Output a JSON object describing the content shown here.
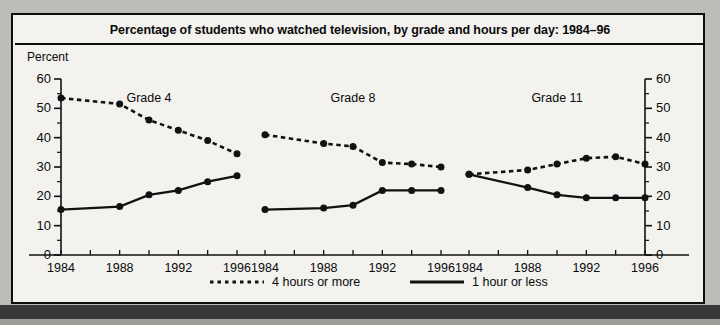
{
  "figure": {
    "title": "Percentage of students who watched television, by grade and hours per day: 1984–96",
    "axis_unit_label": "Percent"
  },
  "legend": {
    "items": [
      {
        "label": "4 hours or more",
        "style": "dotted",
        "color": "#111111"
      },
      {
        "label": "1 hour or less",
        "style": "solid",
        "color": "#111111"
      }
    ]
  },
  "chart_data": {
    "type": "line",
    "title": "Percentage of students who watched television, by grade and hours per day: 1984–96",
    "xlabel": "",
    "ylabel": "Percent",
    "ylim": [
      0,
      60
    ],
    "ytick_labels": [
      "0",
      "10",
      "20",
      "30",
      "40",
      "50",
      "60"
    ],
    "ytick_values": [
      0,
      10,
      20,
      30,
      40,
      50,
      60
    ],
    "yminor_step": 5,
    "grid": false,
    "legend_position": "bottom",
    "dual_y_axis": true,
    "xlim": [
      1984,
      1996
    ],
    "x": [
      1984,
      1988,
      1990,
      1992,
      1994,
      1996
    ],
    "xtick_values": [
      1984,
      1986,
      1988,
      1990,
      1992,
      1994,
      1996
    ],
    "xtick_labels": [
      "1984",
      "",
      "1988",
      "",
      "1992",
      "",
      "1996"
    ],
    "panels": [
      {
        "name": "Grade 4",
        "series": [
          {
            "name": "4 hours or more",
            "style": "dotted",
            "values": [
              53.5,
              51.5,
              46,
              42.5,
              39,
              34.5
            ]
          },
          {
            "name": "1 hour or less",
            "style": "solid",
            "values": [
              15.5,
              16.5,
              20.5,
              22,
              25,
              27
            ]
          }
        ]
      },
      {
        "name": "Grade 8",
        "series": [
          {
            "name": "4 hours or more",
            "style": "dotted",
            "values": [
              41,
              38,
              37,
              31.5,
              31,
              30
            ]
          },
          {
            "name": "1 hour or less",
            "style": "solid",
            "values": [
              15.5,
              16,
              17,
              22,
              22,
              22
            ]
          }
        ]
      },
      {
        "name": "Grade 11",
        "series": [
          {
            "name": "4 hours or more",
            "style": "dotted",
            "values": [
              27.5,
              29,
              31,
              33,
              33.5,
              31
            ]
          },
          {
            "name": "1 hour or less",
            "style": "solid",
            "values": [
              27.5,
              23,
              20.5,
              19.5,
              19.5,
              19.5
            ]
          }
        ]
      }
    ]
  }
}
